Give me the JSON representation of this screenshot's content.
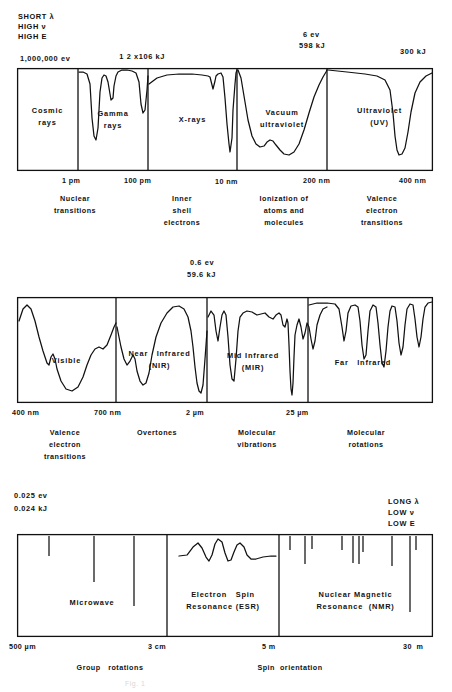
{
  "figure": {
    "caption": "Fig. 1"
  },
  "corner_notes": {
    "top_left": [
      "SHORT λ",
      "HIGH ν",
      "HIGH E"
    ],
    "bottom_right": [
      "LONG λ",
      "LOW ν",
      "LOW E"
    ]
  },
  "energy_labels": {
    "row1_left": "1,000,000 ev",
    "row1_mid_prefix": "1 2 x10",
    "row1_mid_exp": "6",
    "row1_mid_suffix": " kJ",
    "row1_right_ev": "6 ev",
    "row1_right_kj": "598 kJ",
    "row1_far_right": "300 kJ",
    "row2_ev": "0.6 ev",
    "row2_kj": "59.6 kJ",
    "row3_ev": "0.025 ev",
    "row3_kj": "0.024 kJ"
  },
  "bands": [
    {
      "id": "band-1",
      "segments": [
        {
          "name": "Cosmic\nrays"
        },
        {
          "name": "Gamma\nrays"
        },
        {
          "name": "X-rays"
        },
        {
          "name": "Vacuum\nultraviolet"
        },
        {
          "name": "Ultraviolet\n(UV)"
        }
      ],
      "ticks": [
        "1 pm",
        "100 pm",
        "10 nm",
        "200 nm",
        "400 nm"
      ],
      "processes": [
        "Nuclear\ntransitions",
        "Inner\nshell\nelectrons",
        "Ionization of\natoms and\nmolecules",
        "Valence\nelectron\ntransitions"
      ]
    },
    {
      "id": "band-2",
      "segments": [
        {
          "name": "Visible"
        },
        {
          "name": "Near   Infrared\n(NIR)"
        },
        {
          "name": "Mid Infrared\n(MIR)"
        },
        {
          "name": "Far   Infrared"
        }
      ],
      "ticks": [
        "400 nm",
        "700 nm",
        "2 µm",
        "25 µm"
      ],
      "processes": [
        "Valence\nelectron\ntransitions",
        "Overtones",
        "Molecular\nvibrations",
        "Molecular\nrotations"
      ]
    },
    {
      "id": "band-3",
      "segments": [
        {
          "name": "Microwave"
        },
        {
          "name": "Electron   Spin\nResonance (ESR)"
        },
        {
          "name": "Nuclear Magnetic\nResonance  (NMR)"
        }
      ],
      "ticks": [
        "500 µm",
        "3 cm",
        "5 m",
        "30  m"
      ],
      "processes": [
        "Group   rotations",
        "Spin  orientation"
      ]
    }
  ],
  "colors": {
    "ink": "#111111",
    "background": "#ffffff"
  },
  "chart_data": {
    "type": "line",
    "xlabel": "Wavelength",
    "ylabel": "Transmittance / intensity",
    "grid": false,
    "legend": "none",
    "panels": [
      {
        "name": "High energy panel",
        "boundaries": [
          "1 pm",
          "100 pm",
          "10 nm",
          "200 nm",
          "400 nm"
        ],
        "regions": [
          "Cosmic rays",
          "Gamma rays",
          "X-rays",
          "Vacuum ultraviolet",
          "Ultraviolet (UV)"
        ],
        "energy_markers": [
          "1,000,000 ev",
          "1.2x10^6 kJ",
          "6 ev / 598 kJ",
          "300 kJ"
        ]
      },
      {
        "name": "Infrared panel",
        "boundaries": [
          "400 nm",
          "700 nm",
          "2 µm",
          "25 µm"
        ],
        "regions": [
          "Visible",
          "Near Infrared (NIR)",
          "Mid Infrared (MIR)",
          "Far Infrared"
        ],
        "energy_markers": [
          "0.6 ev",
          "59.6 kJ"
        ]
      },
      {
        "name": "Low energy panel",
        "boundaries": [
          "500 µm",
          "3 cm",
          "5 m",
          "30 m"
        ],
        "regions": [
          "Microwave",
          "Electron Spin Resonance (ESR)",
          "Nuclear Magnetic Resonance (NMR)"
        ],
        "energy_markers": [
          "0.025 ev",
          "0.024 kJ"
        ]
      }
    ]
  }
}
